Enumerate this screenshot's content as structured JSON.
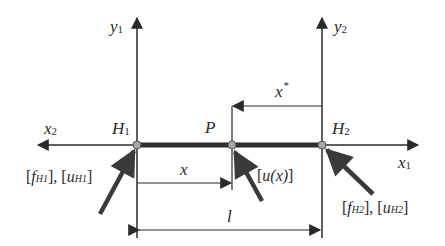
{
  "diagram": {
    "type": "beam-element-coordinate-diagram",
    "colors": {
      "line": "#2a2a2a",
      "beam": "#2e2e2e",
      "node_fill": "#a8a8a8",
      "force_arrow": "#3a3a3a",
      "background": "#ffffff"
    },
    "nodes": [
      {
        "id": "H1",
        "label": "H",
        "sub": "1",
        "x": 137,
        "y": 145
      },
      {
        "id": "P",
        "label": "P",
        "sub": "",
        "x": 232,
        "y": 145
      },
      {
        "id": "H2",
        "label": "H",
        "sub": "2",
        "x": 322,
        "y": 145
      }
    ],
    "axes": {
      "y1": {
        "label": "y",
        "sub": "1"
      },
      "y2": {
        "label": "y",
        "sub": "2"
      },
      "x1": {
        "label": "x",
        "sub": "1"
      },
      "x2": {
        "label": "x",
        "sub": "2"
      }
    },
    "dimensions": {
      "x": {
        "label": "x"
      },
      "x_star": {
        "label": "x",
        "sup": "*"
      },
      "l": {
        "label": "l"
      }
    },
    "loads": {
      "H1": {
        "open1": "[",
        "f": "f",
        "f_sub": "H1",
        "mid": "], [",
        "u": "u",
        "u_sub": "H1",
        "close": "]"
      },
      "P": {
        "text_open": "[",
        "u": "u",
        "paren": "(x)",
        "close": "]"
      },
      "H2": {
        "open1": "[",
        "f": "f",
        "f_sub": "H2",
        "mid": "], [",
        "u": "u",
        "u_sub": "H2",
        "close": "]"
      }
    }
  }
}
